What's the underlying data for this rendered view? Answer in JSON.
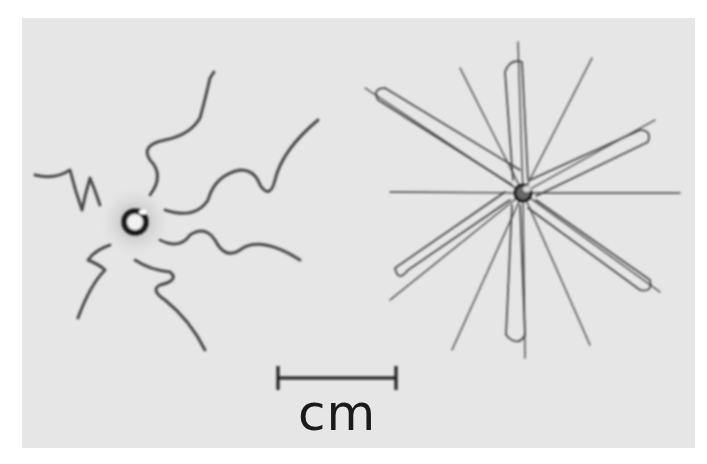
{
  "figure": {
    "left_object": "coiled-wire-device",
    "right_object": "radial-loop-wire-device"
  },
  "scale_bar": {
    "label": "cm"
  },
  "colors": {
    "background": "#e6e6e6",
    "border": "#ffffff",
    "wire": "#3a3a3a"
  }
}
